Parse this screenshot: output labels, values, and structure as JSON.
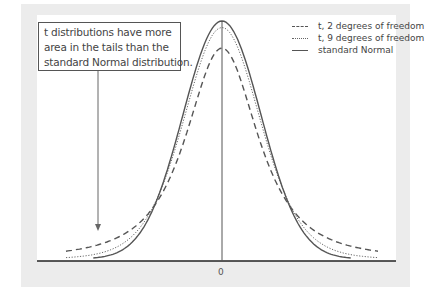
{
  "annotation": {
    "lines": [
      "t distributions have more",
      "area in the tails than the",
      "standard Normal distribution."
    ]
  },
  "legend": [
    {
      "label": "t, 2 degrees of freedom",
      "style": "dashed"
    },
    {
      "label": "t, 9 degrees of freedom",
      "style": "dotted"
    },
    {
      "label": "standard Normal",
      "style": "solid"
    }
  ],
  "colors": {
    "frame": "#ececec",
    "curve": "#555555",
    "axis": "#222222"
  },
  "chart_data": {
    "type": "line",
    "title": "",
    "xlabel": "",
    "ylabel": "",
    "x_ticks": [
      "0"
    ],
    "xlim": [
      -4,
      4
    ],
    "series": [
      {
        "name": "t, 2 degrees of freedom",
        "style": "dashed",
        "peak_density": 0.354
      },
      {
        "name": "t, 9 degrees of freedom",
        "style": "dotted",
        "peak_density": 0.388
      },
      {
        "name": "standard Normal",
        "style": "solid",
        "peak_density": 0.399
      }
    ],
    "annotation": "t distributions have more area in the tails than the standard Normal distribution.",
    "legend_position": "upper right",
    "grid": false
  }
}
